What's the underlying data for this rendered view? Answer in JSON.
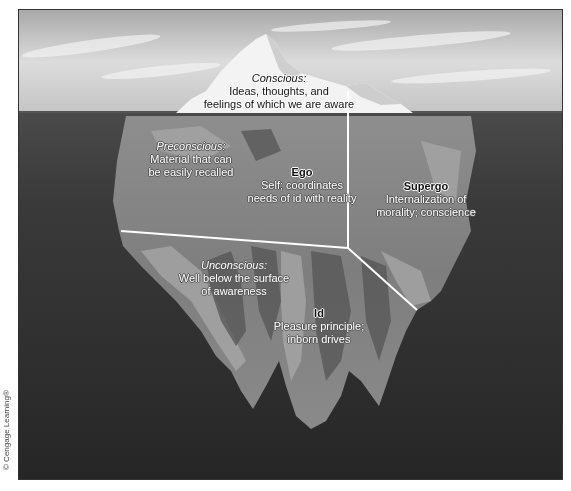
{
  "diagram": {
    "type": "iceberg-model-of-mind",
    "credit": "© Cengage Learning®",
    "colors": {
      "sky_top": "#a9a9a9",
      "sky_bottom": "#e6e6e6",
      "water": "#2b2b2b",
      "iceberg_tip": "#f4f4f4",
      "iceberg_light": "#9c9c9c",
      "iceberg_mid": "#7c7c7c",
      "iceberg_dark": "#5a5a5a",
      "divider": "#ffffff"
    },
    "regions": {
      "conscious": {
        "title": "Conscious:",
        "lines": [
          "Ideas, thoughts, and",
          "feelings of which we are aware"
        ]
      },
      "preconscious": {
        "title": "Preconscious:",
        "lines": [
          "Material that can",
          "be easily recalled"
        ]
      },
      "unconscious": {
        "title": "Unconscious:",
        "lines": [
          "Well below the surface",
          "of awareness"
        ]
      }
    },
    "structures": {
      "ego": {
        "name": "Ego",
        "lines": [
          "Self; coordinates",
          "needs of id with reality"
        ]
      },
      "supergo": {
        "name": "Supergo",
        "lines": [
          "Internalization of",
          "morality; conscience"
        ]
      },
      "id": {
        "name": "Id",
        "lines": [
          "Pleasure principle;",
          "inborn drives"
        ]
      }
    }
  }
}
